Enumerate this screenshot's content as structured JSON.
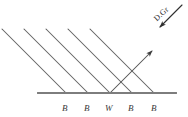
{
  "figure": {
    "background_color": "#ffffff",
    "stroke_color": "#5a5a5a",
    "baseline_color": "#7d7d7d",
    "text_color": "#3a3a3a"
  },
  "annotation": {
    "label": "D.Gr",
    "rotation_degrees": -43
  },
  "baseline": {
    "name": "surface-line",
    "x_start": 38,
    "x_end": 176,
    "y": 93
  },
  "incident_rays": {
    "count": 5,
    "angle_label": "45",
    "lines": [
      {
        "x1": 2,
        "y1": 29,
        "x2": 66,
        "y2": 93
      },
      {
        "x1": 24,
        "y1": 29,
        "x2": 88,
        "y2": 93
      },
      {
        "x1": 46,
        "y1": 29,
        "x2": 110,
        "y2": 93
      },
      {
        "x1": 68,
        "y1": 29,
        "x2": 132,
        "y2": 93
      },
      {
        "x1": 90,
        "y1": 29,
        "x2": 154,
        "y2": 93
      }
    ]
  },
  "reflected_ray": {
    "name": "reflected-ray",
    "x1": 110,
    "y1": 93,
    "x2": 152,
    "y2": 51,
    "has_arrowhead": true
  },
  "direction_arrow": {
    "name": "direction-arrow",
    "x1": 182,
    "y1": 5,
    "x2": 160,
    "y2": 27,
    "has_arrowhead": true
  },
  "surface_points": [
    {
      "label": "B",
      "x": 62,
      "y": 104
    },
    {
      "label": "B",
      "x": 84,
      "y": 104
    },
    {
      "label": "W",
      "x": 105,
      "y": 104
    },
    {
      "label": "B",
      "x": 128,
      "y": 104
    },
    {
      "label": "B",
      "x": 151,
      "y": 104
    }
  ]
}
